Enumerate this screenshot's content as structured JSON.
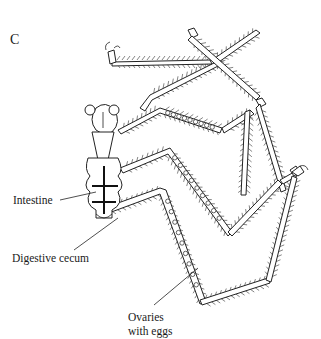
{
  "figure": {
    "panel_letter": "C"
  },
  "labels": {
    "intestine": "Intestine",
    "digestive_cecum": "Digestive cecum",
    "ovaries_line1": "Ovaries",
    "ovaries_line2": "with eggs"
  }
}
